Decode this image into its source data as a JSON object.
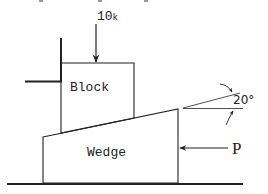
{
  "diagram": {
    "type": "free-body / mechanics diagram",
    "labels": {
      "load": "10",
      "load_unit": "k",
      "block": "Block",
      "wedge": "Wedge",
      "force": "P",
      "angle": "20°"
    },
    "colors": {
      "line": "#222222",
      "background": "#ffffff"
    }
  }
}
